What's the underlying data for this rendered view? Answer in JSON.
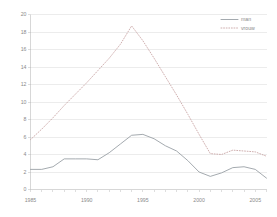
{
  "chart_data": {
    "type": "line",
    "title": "",
    "subtitle": "",
    "xlabel": "",
    "ylabel": "",
    "xlim": [
      1985,
      2006
    ],
    "ylim": [
      0,
      20
    ],
    "grid": true,
    "legend_position": "top-right",
    "x": [
      1985,
      1986,
      1987,
      1988,
      1989,
      1990,
      1991,
      1992,
      1993,
      1994,
      1995,
      1996,
      1997,
      1998,
      1999,
      2000,
      2001,
      2002,
      2003,
      2004,
      2005,
      2006
    ],
    "y_ticks": [
      0,
      2,
      4,
      6,
      8,
      10,
      12,
      14,
      16,
      18,
      20
    ],
    "y_tick_labels": [
      "0",
      "2",
      "4",
      "6",
      "8",
      "10",
      "12",
      "14",
      "16",
      "18",
      "20"
    ],
    "x_ticks": [
      1985,
      1986,
      1987,
      1988,
      1989,
      1990,
      1991,
      1992,
      1993,
      1994,
      1995,
      1996,
      1997,
      1998,
      1999,
      2000,
      2001,
      2002,
      2003,
      2004,
      2005,
      2006
    ],
    "x_tick_labels": [
      "1985",
      "",
      "",
      "",
      "",
      "1990",
      "",
      "",
      "",
      "",
      "1995",
      "",
      "",
      "",
      "",
      "2000",
      "",
      "",
      "",
      "",
      "2005",
      ""
    ],
    "series": [
      {
        "name": "man",
        "style": "solid",
        "color": "#9aa0a6",
        "values": [
          2.3,
          2.3,
          2.6,
          3.5,
          3.5,
          3.5,
          3.4,
          4.2,
          5.2,
          6.2,
          6.3,
          5.8,
          5.0,
          4.4,
          3.3,
          2.0,
          1.5,
          1.9,
          2.5,
          2.6,
          2.3,
          1.3
        ]
      },
      {
        "name": "vrouw",
        "style": "dotted",
        "color": "#c9a6a6",
        "values": [
          5.7,
          6.9,
          8.2,
          9.6,
          10.9,
          12.2,
          13.6,
          15.0,
          16.6,
          18.7,
          17.0,
          15.0,
          12.9,
          10.8,
          8.6,
          6.3,
          4.1,
          4.0,
          4.5,
          4.4,
          4.3,
          3.8
        ]
      }
    ]
  },
  "legend": {
    "items": [
      {
        "label": "man",
        "style": "solid",
        "color": "#9aa0a6"
      },
      {
        "label": "vrouw",
        "style": "dotted",
        "color": "#c9a6a6"
      }
    ]
  },
  "colors": {
    "background": "#ffffff",
    "grid": "#d9d9d9",
    "axis": "#bdbdbd",
    "tick_text": "#8a8a8a",
    "man": "#9aa0a6",
    "vrouw": "#c9a6a6"
  }
}
